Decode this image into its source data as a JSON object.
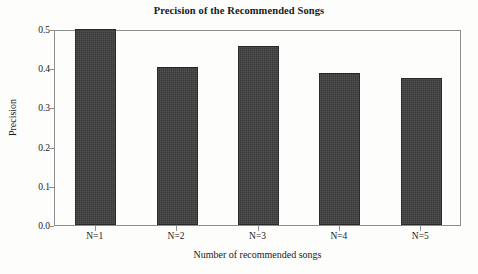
{
  "chart_data": {
    "type": "bar",
    "title": "Precision of the Recommended Songs",
    "xlabel": "Number of recommended songs",
    "ylabel": "Precision",
    "categories": [
      "N=1",
      "N=2",
      "N=3",
      "N=4",
      "N=5"
    ],
    "values": [
      0.501,
      0.402,
      0.456,
      0.388,
      0.374
    ],
    "ylim": [
      0.0,
      0.5
    ],
    "ytick_labels": [
      "0.0",
      "0.1",
      "0.2",
      "0.3",
      "0.4",
      "0.5"
    ],
    "ytick_values": [
      0.0,
      0.1,
      0.2,
      0.3,
      0.4,
      0.5
    ],
    "grid": false,
    "legend": null,
    "bar_color": "#3f3f3f",
    "frame_color": "#8e8e8e",
    "background_color": "#fdfdfc",
    "series": [
      {
        "name": "Precision",
        "values": [
          0.501,
          0.402,
          0.456,
          0.388,
          0.374
        ]
      }
    ]
  }
}
